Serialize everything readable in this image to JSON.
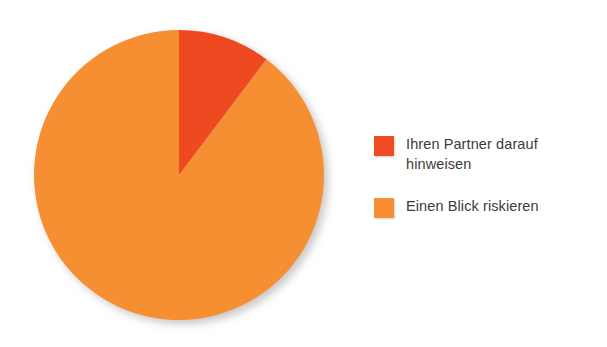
{
  "chart_data": {
    "type": "pie",
    "title": "",
    "subtitle": "",
    "xlabel": "",
    "ylabel": "",
    "grid": false,
    "legend_position": "right",
    "start_angle_deg": 0,
    "direction": "clockwise",
    "categories": [
      "Ihren Partner darauf hinweisen",
      "Einen Blick riskieren"
    ],
    "values": [
      10.3,
      89.7
    ],
    "units": "percent",
    "slices": [
      {
        "label": "Ihren Partner darauf hinweisen",
        "label_line1": "Ihren Partner darauf",
        "label_line2": "hinweisen",
        "value": 10.3,
        "angle_deg": 37,
        "color": "#ef4a20"
      },
      {
        "label": "Einen Blick riskieren",
        "label_line1": "Einen Blick riskieren",
        "label_line2": "",
        "value": 89.7,
        "angle_deg": 323,
        "color": "#f68f33"
      }
    ],
    "annotations": []
  },
  "legend": {
    "entries": [
      {
        "swatch_name": "legend-swatch-ihren-partner-darauf-hinweisen",
        "label": "Ihren Partner darauf\nhinweisen",
        "color": "#ef4a20"
      },
      {
        "swatch_name": "legend-swatch-einen-blick-riskieren",
        "label": "Einen Blick riskieren",
        "color": "#f68f33"
      }
    ]
  },
  "colors": {
    "slice_red_orange": "#ef4a20",
    "slice_orange": "#f68f33",
    "text": "#3b3b3b",
    "background": "#ffffff"
  }
}
